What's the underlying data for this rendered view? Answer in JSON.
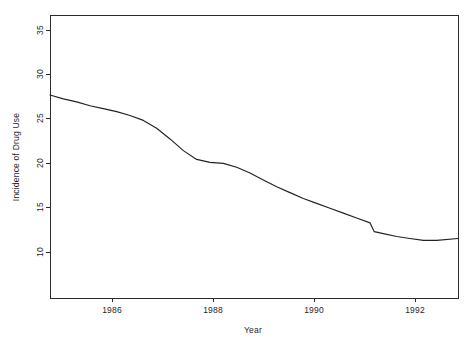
{
  "chart_data": {
    "type": "line",
    "title": "",
    "subtitle": "",
    "xlabel": "Year",
    "ylabel": "Incidence of Drug Use",
    "xlim": [
      1985.0,
      1992.65
    ],
    "ylim": [
      7.2,
      36.2
    ],
    "xticks": [
      1986,
      1988,
      1990,
      1992
    ],
    "xtick_labels": [
      "1986",
      "1988",
      "1990",
      "1992"
    ],
    "yticks": [
      10,
      15,
      20,
      25,
      30,
      35
    ],
    "ytick_labels": [
      "10",
      "15",
      "20",
      "25",
      "30",
      "35"
    ],
    "grid": false,
    "legend": null,
    "legend_position": "none",
    "annotations": [],
    "series": [
      {
        "name": "Incidence of Drug Use",
        "color": "#222222",
        "x": [
          1985.0,
          1985.25,
          1985.5,
          1985.75,
          1986.0,
          1986.25,
          1986.5,
          1986.75,
          1987.0,
          1987.25,
          1987.5,
          1987.75,
          1988.0,
          1988.25,
          1988.5,
          1988.75,
          1989.0,
          1989.25,
          1989.5,
          1989.75,
          1990.0,
          1990.25,
          1990.5,
          1990.75,
          1991.0,
          1991.08,
          1991.25,
          1991.5,
          1991.75,
          1992.0,
          1992.25,
          1992.65
        ],
        "y": [
          28.0,
          27.6,
          27.3,
          26.9,
          26.6,
          26.3,
          25.9,
          25.4,
          24.6,
          23.5,
          22.3,
          21.4,
          21.1,
          21.0,
          20.6,
          20.0,
          19.3,
          18.6,
          18.0,
          17.4,
          16.9,
          16.4,
          15.9,
          15.4,
          14.9,
          14.0,
          13.8,
          13.5,
          13.3,
          13.1,
          13.1,
          13.3
        ]
      }
    ]
  },
  "axes": {
    "x_axis_title": "Year",
    "y_axis_title": "Incidence of Drug Use"
  }
}
